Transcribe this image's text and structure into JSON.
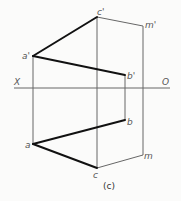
{
  "figure": {
    "caption": "(c)",
    "axis": {
      "left_label": "X",
      "right_label": "O"
    },
    "points": {
      "a_prime": {
        "label": "a'"
      },
      "b_prime": {
        "label": "b'"
      },
      "c_prime": {
        "label": "c'"
      },
      "m_prime": {
        "label": "m'"
      },
      "a": {
        "label": "a"
      },
      "b": {
        "label": "b"
      },
      "c": {
        "label": "c"
      },
      "m": {
        "label": "m"
      }
    }
  }
}
